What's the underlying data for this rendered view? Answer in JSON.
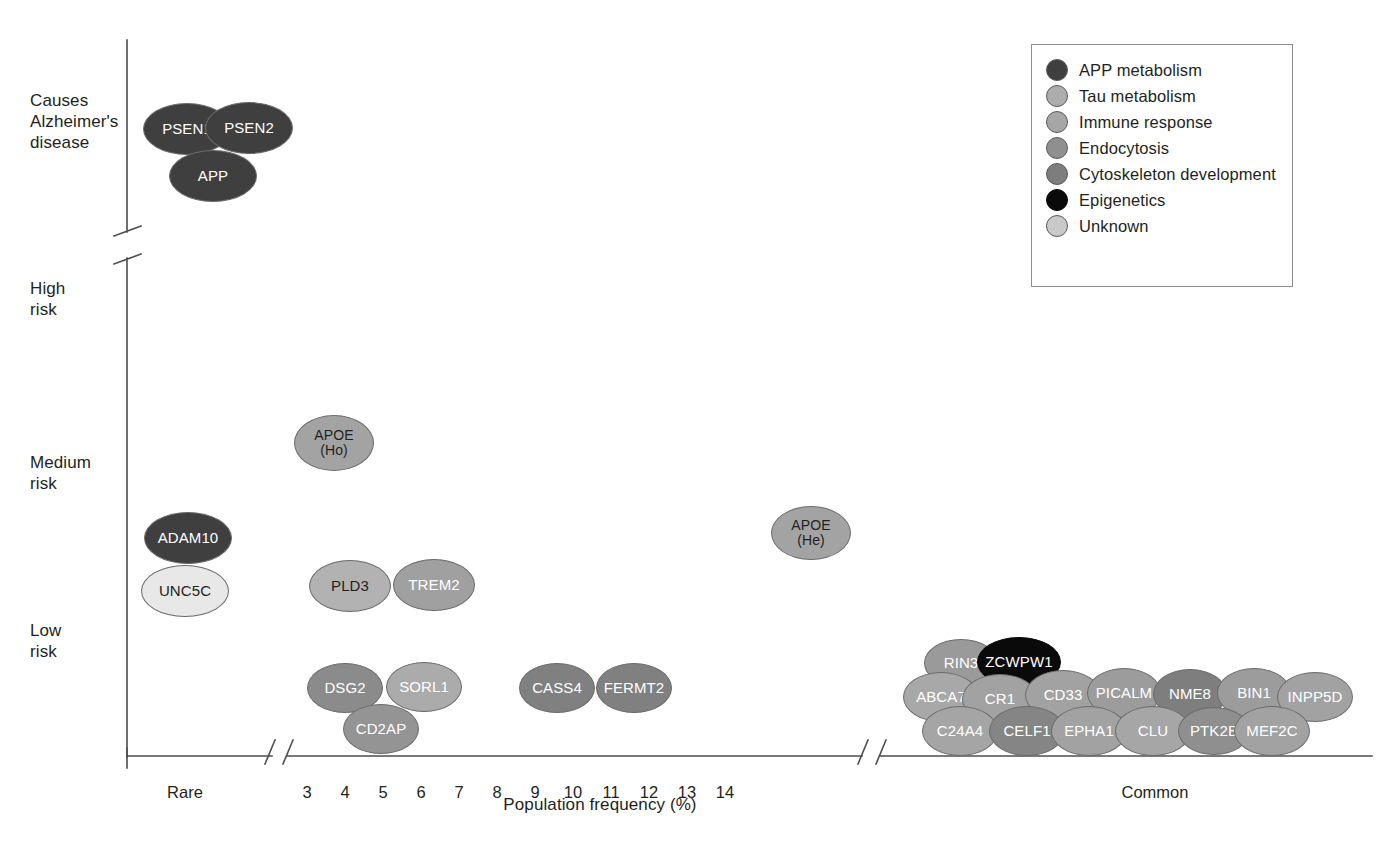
{
  "figure": {
    "x_axis_title": "Population frequency (%)",
    "x_tick_labels": [
      "Rare",
      "3",
      "4",
      "5",
      "6",
      "7",
      "8",
      "9",
      "10",
      "11",
      "12",
      "13",
      "14",
      "Common"
    ],
    "y_axis_labels": [
      "Causes\nAlzheimer's\ndisease",
      "High\nrisk",
      "Medium\nrisk",
      "Low\nrisk"
    ]
  },
  "legend": {
    "items": [
      {
        "label": "APP metabolism",
        "color": "#3f3f3f"
      },
      {
        "label": "Tau metabolism",
        "color": "#adadad"
      },
      {
        "label": "Immune response",
        "color": "#a6a6a6"
      },
      {
        "label": "Endocytosis",
        "color": "#8f8f8f"
      },
      {
        "label": "Cytoskeleton development",
        "color": "#7d7d7d"
      },
      {
        "label": "Epigenetics",
        "color": "#0a0a0a"
      },
      {
        "label": "Unknown",
        "color": "#c9c9c9"
      }
    ]
  },
  "chart_data": {
    "type": "scatter",
    "title": "",
    "xlabel": "Population frequency (%)",
    "ylabel": "",
    "grid": false,
    "legend_position": "top-right",
    "x_category_labels": [
      "Rare",
      "Common"
    ],
    "x_numeric_ticks": [
      3,
      4,
      5,
      6,
      7,
      8,
      9,
      10,
      11,
      12,
      13,
      14
    ],
    "y_categories": [
      "Causes Alzheimer's disease",
      "High risk",
      "Medium risk",
      "Low risk"
    ],
    "axis_breaks": {
      "x": [
        "after Rare",
        "before Common"
      ],
      "y": [
        "between Causes Alzheimer's disease and High risk"
      ]
    },
    "categories_legend": [
      "APP metabolism",
      "Tau metabolism",
      "Immune response",
      "Endocytosis",
      "Cytoskeleton development",
      "Epigenetics",
      "Unknown"
    ],
    "points": [
      {
        "label": "PSEN1",
        "frequency": "Rare",
        "risk": "Causes Alzheimer's disease",
        "category": "APP metabolism",
        "color": "#3f3f3f",
        "text": "#ffffff",
        "x": 187,
        "y": 129,
        "rx": 44,
        "ry": 26
      },
      {
        "label": "PSEN2",
        "frequency": "Rare",
        "risk": "Causes Alzheimer's disease",
        "category": "APP metabolism",
        "color": "#3f3f3f",
        "text": "#ffffff",
        "x": 249,
        "y": 128,
        "rx": 44,
        "ry": 26
      },
      {
        "label": "APP",
        "frequency": "Rare",
        "risk": "Causes Alzheimer's disease",
        "category": "APP metabolism",
        "color": "#3f3f3f",
        "text": "#ffffff",
        "x": 213,
        "y": 176,
        "rx": 44,
        "ry": 26
      },
      {
        "label": "APOE\n(Ho)",
        "frequency": 4.2,
        "risk": "Medium risk",
        "category": "Tau metabolism",
        "color": "#a3a3a3",
        "text": "#231f20",
        "x": 334,
        "y": 443,
        "rx": 40,
        "ry": 28
      },
      {
        "label": "ADAM10",
        "frequency": "Rare",
        "risk": "Medium risk",
        "category": "APP metabolism",
        "color": "#3f3f3f",
        "text": "#ffffff",
        "x": 188,
        "y": 538,
        "rx": 44,
        "ry": 26
      },
      {
        "label": "APOE\n(He)",
        "frequency": 13.2,
        "risk": "Medium risk",
        "category": "Tau metabolism",
        "color": "#a3a3a3",
        "text": "#231f20",
        "x": 811,
        "y": 533,
        "rx": 40,
        "ry": 27
      },
      {
        "label": "UNC5C",
        "frequency": "Rare",
        "risk": "Low risk",
        "category": "Unknown",
        "color": "#e8e8e8",
        "text": "#231f20",
        "x": 185,
        "y": 591,
        "rx": 44,
        "ry": 26
      },
      {
        "label": "PLD3",
        "frequency": 4.3,
        "risk": "Low risk",
        "category": "Tau metabolism",
        "color": "#b2b2b2",
        "text": "#231f20",
        "x": 350,
        "y": 586,
        "rx": 41,
        "ry": 26
      },
      {
        "label": "TREM2",
        "frequency": 6.2,
        "risk": "Low risk",
        "category": "Immune response",
        "color": "#a0a0a0",
        "text": "#ffffff",
        "x": 434,
        "y": 585,
        "rx": 41,
        "ry": 26
      },
      {
        "label": "DSG2",
        "frequency": 3.9,
        "risk": "Low risk",
        "category": "Endocytosis",
        "color": "#8b8b8b",
        "text": "#ffffff",
        "x": 345,
        "y": 688,
        "rx": 38,
        "ry": 25
      },
      {
        "label": "SORL1",
        "frequency": 5.8,
        "risk": "Low risk",
        "category": "Tau metabolism",
        "color": "#ababab",
        "text": "#ffffff",
        "x": 424,
        "y": 687,
        "rx": 38,
        "ry": 25
      },
      {
        "label": "CD2AP",
        "frequency": 4.8,
        "risk": "Low risk",
        "category": "Endocytosis",
        "color": "#949494",
        "text": "#ffffff",
        "x": 381,
        "y": 729,
        "rx": 38,
        "ry": 25
      },
      {
        "label": "CASS4",
        "frequency": 8.9,
        "risk": "Low risk",
        "category": "Cytoskeleton development",
        "color": "#808080",
        "text": "#ffffff",
        "x": 557,
        "y": 688,
        "rx": 38,
        "ry": 25
      },
      {
        "label": "FERMT2",
        "frequency": 10.4,
        "risk": "Low risk",
        "category": "Cytoskeleton development",
        "color": "#808080",
        "text": "#ffffff",
        "x": 634,
        "y": 688,
        "rx": 38,
        "ry": 25
      },
      {
        "label": "RIN3",
        "frequency": "Common",
        "risk": "Low risk",
        "category": "Endocytosis",
        "color": "#9a9a9a",
        "text": "#ffffff",
        "x": 961,
        "y": 663,
        "rx": 37,
        "ry": 24
      },
      {
        "label": "ZCWPW1",
        "frequency": "Common",
        "risk": "Low risk",
        "category": "Epigenetics",
        "color": "#0a0a0a",
        "text": "#ffffff",
        "x": 1019,
        "y": 662,
        "rx": 42,
        "ry": 25
      },
      {
        "label": "ABCA7",
        "frequency": "Common",
        "risk": "Low risk",
        "category": "Tau metabolism",
        "color": "#a8a8a8",
        "text": "#ffffff",
        "x": 941,
        "y": 697,
        "rx": 38,
        "ry": 25
      },
      {
        "label": "CR1",
        "frequency": "Common",
        "risk": "Low risk",
        "category": "Immune response",
        "color": "#a2a2a2",
        "text": "#ffffff",
        "x": 1000,
        "y": 699,
        "rx": 38,
        "ry": 25
      },
      {
        "label": "CD33",
        "frequency": "Common",
        "risk": "Low risk",
        "category": "Immune response",
        "color": "#a2a2a2",
        "text": "#ffffff",
        "x": 1063,
        "y": 695,
        "rx": 38,
        "ry": 25
      },
      {
        "label": "PICALM",
        "frequency": "Common",
        "risk": "Low risk",
        "category": "Endocytosis",
        "color": "#9c9c9c",
        "text": "#ffffff",
        "x": 1124,
        "y": 693,
        "rx": 37,
        "ry": 25
      },
      {
        "label": "NME8",
        "frequency": "Common",
        "risk": "Low risk",
        "category": "Cytoskeleton development",
        "color": "#7e7e7e",
        "text": "#ffffff",
        "x": 1190,
        "y": 694,
        "rx": 37,
        "ry": 25
      },
      {
        "label": "BIN1",
        "frequency": "Common",
        "risk": "Low risk",
        "category": "Endocytosis",
        "color": "#9c9c9c",
        "text": "#ffffff",
        "x": 1254,
        "y": 693,
        "rx": 37,
        "ry": 25
      },
      {
        "label": "INPP5D",
        "frequency": "Common",
        "risk": "Low risk",
        "category": "Immune response",
        "color": "#a2a2a2",
        "text": "#ffffff",
        "x": 1315,
        "y": 697,
        "rx": 38,
        "ry": 25
      },
      {
        "label": "C24A4",
        "frequency": "Common",
        "risk": "Low risk",
        "category": "Immune response",
        "color": "#a5a5a5",
        "text": "#ffffff",
        "x": 960,
        "y": 731,
        "rx": 38,
        "ry": 25
      },
      {
        "label": "CELF1",
        "frequency": "Common",
        "risk": "Low risk",
        "category": "Cytoskeleton development",
        "color": "#858585",
        "text": "#ffffff",
        "x": 1027,
        "y": 731,
        "rx": 38,
        "ry": 25
      },
      {
        "label": "EPHA1",
        "frequency": "Common",
        "risk": "Low risk",
        "category": "Immune response",
        "color": "#a2a2a2",
        "text": "#ffffff",
        "x": 1089,
        "y": 731,
        "rx": 38,
        "ry": 25
      },
      {
        "label": "CLU",
        "frequency": "Common",
        "risk": "Low risk",
        "category": "Immune response",
        "color": "#a6a6a6",
        "text": "#ffffff",
        "x": 1153,
        "y": 731,
        "rx": 38,
        "ry": 25
      },
      {
        "label": "PTK2B",
        "frequency": "Common",
        "risk": "Low risk",
        "category": "Cytoskeleton development",
        "color": "#8f8f8f",
        "text": "#ffffff",
        "x": 1214,
        "y": 731,
        "rx": 36,
        "ry": 24
      },
      {
        "label": "MEF2C",
        "frequency": "Common",
        "risk": "Low risk",
        "category": "Immune response",
        "color": "#a2a2a2",
        "text": "#ffffff",
        "x": 1272,
        "y": 731,
        "rx": 38,
        "ry": 25
      }
    ]
  },
  "geometry": {
    "y_axis_x": 127,
    "x_axis_y": 756,
    "y_axis_top": 40,
    "x_axis_right": 1372,
    "y_label_positions": [
      96,
      282,
      455,
      622
    ],
    "x_tick_positions": [
      185,
      307,
      345,
      383,
      421,
      459,
      497,
      535,
      573,
      611,
      649,
      687,
      725,
      1155
    ],
    "x_axis_title_pos": {
      "x": 600,
      "y": 808
    },
    "legend_box": {
      "left": 1031,
      "top": 44,
      "width": 262,
      "height": 243
    }
  }
}
